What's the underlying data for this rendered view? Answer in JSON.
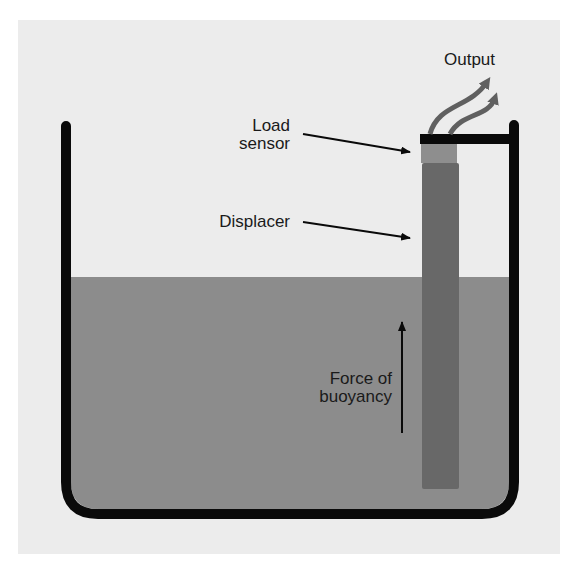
{
  "diagram": {
    "labels": {
      "output": "Output",
      "load_sensor_line1": "Load",
      "load_sensor_line2": "sensor",
      "displacer": "Displacer",
      "buoyancy_line1": "Force of",
      "buoyancy_line2": "buoyancy"
    },
    "colors": {
      "panel": "#ececec",
      "liquid": "#8c8c8c",
      "displacer": "#686868",
      "load_sensor": "#8e8e8e",
      "tank_outline": "#0a0a0a",
      "output_arrows": "#606060"
    }
  }
}
